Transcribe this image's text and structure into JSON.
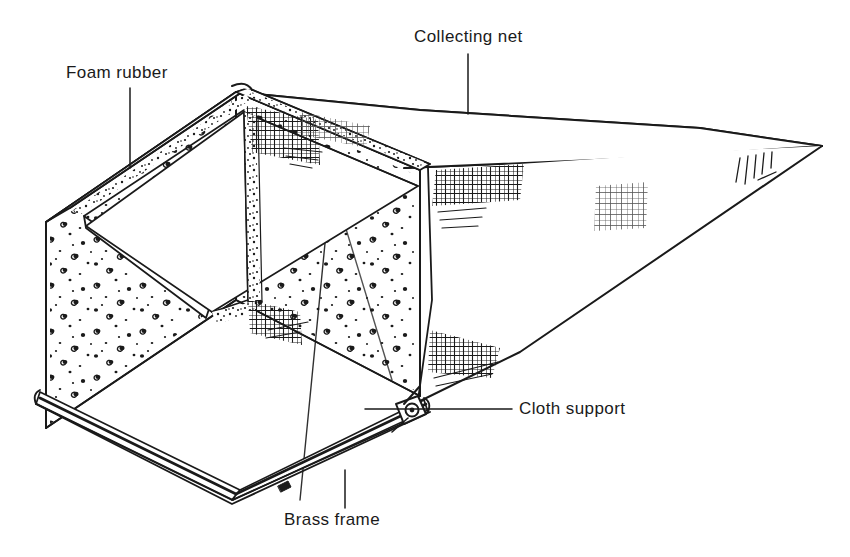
{
  "figure": {
    "type": "line-art technical illustration",
    "background_color": "#ffffff",
    "ink_color": "#1a1a1a"
  },
  "labels": {
    "foam_rubber": "Foam rubber",
    "collecting_net": "Collecting net",
    "cloth_support": "Cloth support",
    "brass_frame": "Brass frame"
  },
  "parts": {
    "foam_box": "foam-rubber-box",
    "net_cone": "collecting-net-cone",
    "brass_frame_rail": "brass-frame-rail",
    "cloth_support_bracket": "cloth-support-bracket"
  }
}
